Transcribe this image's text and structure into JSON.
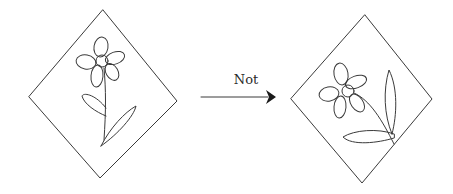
{
  "diagram": {
    "arrow": {
      "label": "Not"
    },
    "figures": [
      {
        "name": "original",
        "shape": "diamond",
        "content": "flower-upright"
      },
      {
        "name": "transformed",
        "shape": "diamond",
        "content": "flower-tilted"
      }
    ],
    "colors": {
      "stroke": "#3a3a3a",
      "background": "#ffffff"
    }
  }
}
